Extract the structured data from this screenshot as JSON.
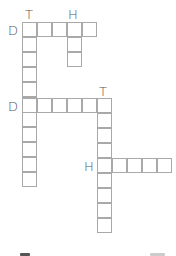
{
  "puzzle": {
    "type": "crossword",
    "cell_size": 15,
    "colors": {
      "grid_line": "#a9a9a9",
      "clue_letter": "#555555"
    },
    "clues": [
      {
        "id": "T1",
        "label": "T",
        "x": 25,
        "y": 8
      },
      {
        "id": "H1",
        "label": "H",
        "x": 68,
        "y": 8
      },
      {
        "id": "D1",
        "label": "D",
        "x": 8,
        "y": 24
      },
      {
        "id": "D2",
        "label": "D",
        "x": 8,
        "y": 100
      },
      {
        "id": "T2",
        "label": "T",
        "x": 99,
        "y": 85
      },
      {
        "id": "H2",
        "label": "H",
        "x": 84,
        "y": 160
      }
    ],
    "words": [
      {
        "id": "across-D1",
        "dir": "across",
        "col0": 22,
        "row0": 22,
        "length": 5
      },
      {
        "id": "down-T1",
        "dir": "down",
        "col0": 22,
        "row0": 22,
        "length": 11
      },
      {
        "id": "down-H1",
        "dir": "down",
        "col0": 67,
        "row0": 22,
        "length": 3
      },
      {
        "id": "across-D2",
        "dir": "across",
        "col0": 22,
        "row0": 98,
        "length": 6
      },
      {
        "id": "down-T2",
        "dir": "down",
        "col0": 97,
        "row0": 98,
        "length": 9
      },
      {
        "id": "across-H2",
        "dir": "across",
        "col0": 97,
        "row0": 158,
        "length": 5
      }
    ]
  },
  "footer_marks": [
    {
      "x": 20,
      "y": 253,
      "w": 10,
      "color": "#555555"
    },
    {
      "x": 150,
      "y": 253,
      "w": 15,
      "color": "#cccccc"
    }
  ]
}
